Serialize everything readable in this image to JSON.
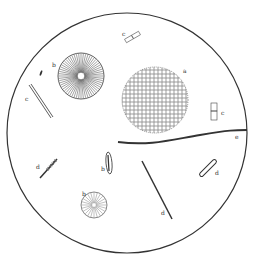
{
  "figure": {
    "background": "#ffffff",
    "ink": "#2a2a2a",
    "field": {
      "cx": 127,
      "cy": 133,
      "r": 120
    }
  },
  "specimens": [
    {
      "id": "a",
      "label": "a",
      "kind": "dotted-sphere"
    },
    {
      "id": "b1",
      "label": "b",
      "kind": "radial-disc-large"
    },
    {
      "id": "b2",
      "label": "b",
      "kind": "radial-disc-small"
    },
    {
      "id": "b3",
      "label": "b",
      "kind": "elongated-cell"
    },
    {
      "id": "c1",
      "label": "c",
      "kind": "chain-top"
    },
    {
      "id": "c2",
      "label": "c",
      "kind": "rod-left"
    },
    {
      "id": "c3",
      "label": "c",
      "kind": "frustule-right"
    },
    {
      "id": "d1",
      "label": "d",
      "kind": "small-rod-left"
    },
    {
      "id": "d2",
      "label": "d",
      "kind": "long-rod"
    },
    {
      "id": "d3",
      "label": "d",
      "kind": "rod-right"
    },
    {
      "id": "e",
      "label": "e",
      "kind": "filament"
    }
  ]
}
